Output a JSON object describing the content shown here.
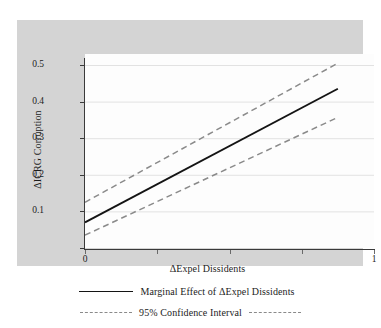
{
  "figure": {
    "panel_background": "#d4d4d4",
    "plot_background": "#fdfdfd",
    "axis_color": "#3a3a3a",
    "grid_color": "#e2e2e2"
  },
  "chart_data": {
    "type": "line",
    "title": "",
    "xlabel": "ΔExpel Dissidents",
    "ylabel": "ΔICRG Corruption",
    "xlim": [
      0,
      1.0
    ],
    "ylim": [
      0,
      0.53
    ],
    "grid": true,
    "legend_position": "below",
    "x_ticks": [
      0,
      0.25,
      0.5,
      0.75,
      1
    ],
    "x_tick_labels": [
      "0",
      "",
      "",
      "",
      "1"
    ],
    "y_ticks": [
      0,
      0.1,
      0.2,
      0.3,
      0.4,
      0.5
    ],
    "y_tick_labels": [
      "",
      "0.1",
      "0.2",
      "0.3",
      "0.4",
      "0.5"
    ],
    "x": [
      0,
      0.875
    ],
    "series": [
      {
        "name": "Marginal Effect of ΔExpel Dissidents",
        "style": "solid",
        "color": "#141414",
        "values": [
          0.07,
          0.435
        ]
      },
      {
        "name": "95% Confidence Interval Upper",
        "style": "dashed",
        "color": "#8a8a8a",
        "values": [
          0.125,
          0.505
        ]
      },
      {
        "name": "95% Confidence Interval Lower",
        "style": "dashed",
        "color": "#8a8a8a",
        "values": [
          0.035,
          0.357
        ]
      }
    ]
  },
  "legend": {
    "rows": [
      {
        "label": "Marginal Effect of ΔExpel Dissidents",
        "style": "solid"
      },
      {
        "label": "95% Confidence Interval",
        "style": "dashed"
      }
    ]
  }
}
